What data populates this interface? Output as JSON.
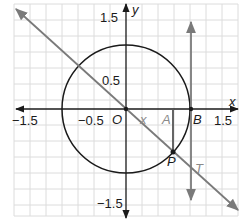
{
  "diagram": {
    "type": "unit-circle-tangent",
    "axes": {
      "x_label": "x",
      "y_label": "y",
      "x_ticks": [
        "−1.5",
        "−0.5",
        "1.5"
      ],
      "y_ticks": [
        "1.5",
        "0.5",
        "−1.5"
      ]
    },
    "points": {
      "origin": "O",
      "a": "A",
      "b": "B",
      "p": "P",
      "t": "T"
    },
    "segment_label": "x",
    "colors": {
      "grid": "#d9d9d9",
      "axis": "#1a1a1a",
      "circle": "#1a1a1a",
      "secant": "#7a7a7a",
      "tangent": "#7a7a7a",
      "vertical_segment": "#555555"
    }
  }
}
